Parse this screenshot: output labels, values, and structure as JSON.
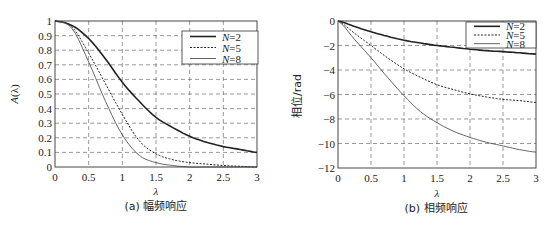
{
  "chart_data": [
    {
      "type": "line",
      "title": "(a) 幅频响应",
      "xlabel": "λ",
      "ylabel": "A(λ)",
      "xlim": [
        0,
        3
      ],
      "ylim": [
        0,
        1
      ],
      "grid": true,
      "legend_position": "upper right",
      "x_ticks": [
        "0",
        "0.5",
        "1",
        "1.5",
        "2",
        "2.5",
        "3"
      ],
      "y_ticks": [
        "0",
        "0.1",
        "0.2",
        "0.3",
        "0.4",
        "0.5",
        "0.6",
        "0.7",
        "0.8",
        "0.9",
        "1"
      ],
      "x": [
        0,
        0.25,
        0.5,
        0.75,
        1,
        1.25,
        1.5,
        1.75,
        2,
        2.25,
        2.5,
        2.75,
        3
      ],
      "series": [
        {
          "name": "N=2",
          "style": "solid-thick",
          "values": [
            1.0,
            0.97,
            0.88,
            0.74,
            0.58,
            0.45,
            0.34,
            0.27,
            0.21,
            0.17,
            0.14,
            0.12,
            0.1
          ]
        },
        {
          "name": "N=5",
          "style": "dotted",
          "values": [
            1.0,
            0.96,
            0.78,
            0.57,
            0.36,
            0.18,
            0.09,
            0.05,
            0.03,
            0.02,
            0.01,
            0.005,
            0.0
          ]
        },
        {
          "name": "N=8",
          "style": "solid-thin",
          "values": [
            1.0,
            0.95,
            0.72,
            0.45,
            0.22,
            0.08,
            0.03,
            0.01,
            0.0,
            0.0,
            0.0,
            0.0,
            0.0
          ]
        }
      ]
    },
    {
      "type": "line",
      "title": "(b) 相频响应",
      "xlabel": "λ",
      "ylabel": "相位/rad",
      "xlim": [
        0,
        3
      ],
      "ylim": [
        -12,
        0
      ],
      "grid": true,
      "legend_position": "upper right",
      "x_ticks": [
        "0",
        "0.5",
        "1",
        "1.5",
        "2",
        "2.5",
        "3"
      ],
      "y_ticks": [
        "0",
        "−2",
        "−4",
        "−6",
        "−8",
        "−10",
        "−12"
      ],
      "x": [
        0,
        0.25,
        0.5,
        0.75,
        1,
        1.25,
        1.5,
        1.75,
        2,
        2.25,
        2.5,
        2.75,
        3
      ],
      "series": [
        {
          "name": "N=2",
          "style": "solid-thick",
          "values": [
            0,
            -0.45,
            -0.88,
            -1.25,
            -1.57,
            -1.8,
            -2.0,
            -2.15,
            -2.3,
            -2.42,
            -2.5,
            -2.6,
            -2.7
          ]
        },
        {
          "name": "N=5",
          "style": "dotted",
          "values": [
            0,
            -1.0,
            -2.0,
            -3.0,
            -3.9,
            -4.6,
            -5.2,
            -5.6,
            -5.95,
            -6.2,
            -6.4,
            -6.5,
            -6.65
          ]
        },
        {
          "name": "N=8",
          "style": "solid-thin",
          "values": [
            0,
            -1.5,
            -3.0,
            -4.6,
            -6.1,
            -7.4,
            -8.3,
            -9.0,
            -9.5,
            -9.9,
            -10.2,
            -10.5,
            -10.7
          ]
        }
      ]
    }
  ],
  "legend": {
    "entries": [
      "N=2",
      "N=5",
      "N=8"
    ],
    "n_labels": [
      "N",
      "N",
      "N"
    ],
    "values": [
      "=2",
      "=5",
      "=8"
    ]
  },
  "captions": {
    "a": "(a) 幅频响应",
    "b": "(b) 相频响应"
  },
  "axis_labels": {
    "a_y_italic": "A",
    "a_y_rest": "(λ)",
    "b_y": "相位/rad",
    "x": "λ"
  }
}
